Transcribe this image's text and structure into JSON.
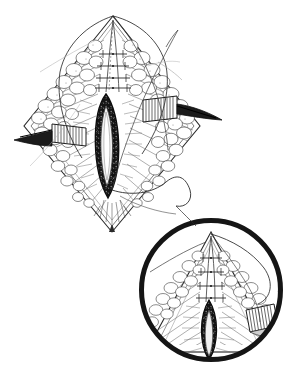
{
  "figure": {
    "kind": "surgical-line-drawing",
    "title": "Diamond-shaped surgical incision with self-retaining retractors and magnified apex inset",
    "style": "pen-and-ink stipple and hatch medical illustration",
    "background_color": "#ffffff",
    "ink_color": "#1a1a1a",
    "mid_tone_color": "#6b6b6b",
    "light_tone_color": "#b8b8b8",
    "width_px": 299,
    "height_px": 379,
    "caption": "",
    "labels": []
  },
  "main_view": {
    "name": "Primary operative field",
    "center_x": 113,
    "center_y": 120,
    "wound": {
      "name": "Open midline incision",
      "shape": "lenticular",
      "center_x": 106,
      "center_y": 146,
      "half_width": 17,
      "half_height": 52,
      "fill_color": "#111111",
      "description": "Dark open wound cavity with exposed deep tissue"
    },
    "skin_flap": {
      "name": "Rhomboid skin and subcutaneous flap",
      "apex_top_x": 113,
      "apex_top_y": 16,
      "apex_bottom_x": 112,
      "apex_bottom_y": 232,
      "left_x": 24,
      "right_x": 200,
      "waist_y": 126,
      "description": "Diamond-shaped reflected flap with lobular subcutaneous fat"
    },
    "fat_lobules": {
      "name": "Subcutaneous fat lobules",
      "pattern": "cobblestone",
      "count": 46
    },
    "muscle_hatching": {
      "name": "Radial muscle fiber hatching",
      "orientation": "radial-to-midline"
    }
  },
  "retractors": [
    {
      "id": "retractor-left",
      "name": "Left retractor blade",
      "blade_x": 52,
      "blade_y": 124,
      "blade_width": 34,
      "blade_height": 20,
      "handle_tip_x": 14,
      "handle_tip_y": 140,
      "teeth": 11,
      "description": "Ribbed retractor blade retracting the left wound edge laterally"
    },
    {
      "id": "retractor-right",
      "name": "Right retractor blade",
      "blade_x": 143,
      "blade_y": 96,
      "blade_width": 34,
      "blade_height": 22,
      "handle_tip_x": 222,
      "handle_tip_y": 121,
      "teeth": 11,
      "description": "Ribbed retractor blade retracting the right wound edge laterally"
    }
  ],
  "sutures": [
    {
      "id": "suture-apex-left",
      "name": "Left apex traction suture",
      "description": "Long curved monofilament looping left of the superior apex"
    },
    {
      "id": "suture-apex-right",
      "name": "Right apex traction suture",
      "description": "Long curved monofilament sweeping right and trailing to the inset"
    },
    {
      "id": "suture-trailing-tail",
      "name": "Trailing suture tail",
      "description": "Free suture tail curling toward the lower right of the field"
    },
    {
      "id": "suture-ladder",
      "name": "Interrupted midline suture ladder",
      "stitch_count": 5,
      "description": "Short interrupted approximating stitches along the upper midline"
    }
  ],
  "inset": {
    "name": "Magnified apex inset",
    "shape": "circle",
    "center_x": 211,
    "center_y": 290,
    "radius": 72,
    "border_width": 5,
    "border_color": "#151515",
    "content_description": "Close-up of the superior apex showing approximated midline, suture ladder and deep wound",
    "apex_x": 211,
    "apex_y": 232,
    "wound": {
      "name": "Magnified deep wound channel",
      "center_x": 209,
      "top_y": 300,
      "bottom_y": 358,
      "half_width": 12,
      "fill_color": "#111111"
    },
    "retractor": {
      "id": "retractor-inset-right",
      "name": "Inset right retractor blade",
      "x": 246,
      "y": 310,
      "width": 28,
      "height": 22
    },
    "suture": {
      "id": "suture-inset-loop",
      "name": "Inset suture loop",
      "description": "Curved suture arcing over the magnified apex to the upper right"
    },
    "fat_lobules": {
      "name": "Magnified fat lobules",
      "count": 24
    }
  }
}
